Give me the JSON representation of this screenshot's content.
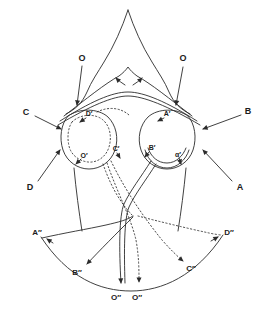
{
  "figure": {
    "colors": {
      "ink": "#2b2b2b",
      "paper": "#ffffff"
    },
    "labels": {
      "outer": [
        {
          "id": "o-left",
          "text": "O"
        },
        {
          "id": "o-right",
          "text": "O"
        },
        {
          "id": "c",
          "text": "C"
        },
        {
          "id": "b",
          "text": "B"
        },
        {
          "id": "d",
          "text": "D"
        },
        {
          "id": "a",
          "text": "A"
        }
      ],
      "inner": [
        {
          "id": "d-prime",
          "text": "D′"
        },
        {
          "id": "a-prime",
          "text": "A′"
        },
        {
          "id": "c-prime",
          "text": "C′"
        },
        {
          "id": "b-prime",
          "text": "B′"
        },
        {
          "id": "o-prime-left",
          "text": "O′"
        },
        {
          "id": "o-prime-right",
          "text": "α′"
        }
      ],
      "bottom": [
        {
          "id": "a-dblprime",
          "text": "A″"
        },
        {
          "id": "b-dblprime",
          "text": "B″"
        },
        {
          "id": "o-dblprime-left",
          "text": "O″"
        },
        {
          "id": "o-dblprime-right",
          "text": "O″"
        },
        {
          "id": "c-dblprime",
          "text": "C″"
        },
        {
          "id": "d-dblprime",
          "text": "D″"
        }
      ]
    }
  }
}
